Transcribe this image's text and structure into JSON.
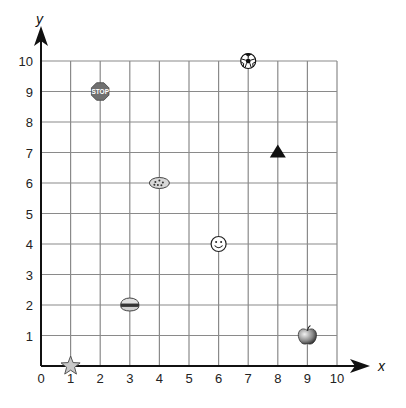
{
  "chart_data": {
    "type": "scatter",
    "title": "",
    "xlabel": "x",
    "ylabel": "y",
    "xlim": [
      0,
      10
    ],
    "ylim": [
      0,
      10
    ],
    "grid": true,
    "x_ticks": [
      "0",
      "1",
      "2",
      "3",
      "4",
      "5",
      "6",
      "7",
      "8",
      "9",
      "10"
    ],
    "y_ticks": [
      "1",
      "2",
      "3",
      "4",
      "5",
      "6",
      "7",
      "8",
      "9",
      "10"
    ],
    "points": [
      {
        "name": "star",
        "icon": "star-icon",
        "x": 1,
        "y": 0
      },
      {
        "name": "hamburger",
        "icon": "hamburger-icon",
        "x": 3,
        "y": 2
      },
      {
        "name": "smiley face",
        "icon": "smiley-icon",
        "x": 6,
        "y": 4
      },
      {
        "name": "apple",
        "icon": "apple-icon",
        "x": 9,
        "y": 1
      },
      {
        "name": "cookie",
        "icon": "cookie-icon",
        "x": 4,
        "y": 6
      },
      {
        "name": "triangle",
        "icon": "triangle-icon",
        "x": 8,
        "y": 7
      },
      {
        "name": "stop sign",
        "icon": "stop-sign-icon",
        "x": 2,
        "y": 9,
        "label": "STOP"
      },
      {
        "name": "soccer ball",
        "icon": "soccer-ball-icon",
        "x": 7,
        "y": 10
      }
    ]
  },
  "colors": {
    "grid": "#8a8a8a",
    "axis": "#111111",
    "stop_sign": "#707070",
    "star": "#c8c8c8",
    "cookie": "#d8d8d8"
  }
}
